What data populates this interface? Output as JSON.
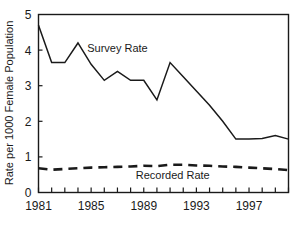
{
  "chart_data": {
    "type": "line",
    "title": "",
    "subtitle": "",
    "xlabel": "",
    "ylabel": "Rate per 1000 Female Population",
    "xlim": [
      1981,
      2000
    ],
    "ylim": [
      0,
      5
    ],
    "grid": false,
    "legend_position": "inline-annotation",
    "x": [
      1981,
      1982,
      1983,
      1984,
      1985,
      1986,
      1987,
      1988,
      1989,
      1990,
      1991,
      1992,
      1993,
      1994,
      1995,
      1996,
      1997,
      1998,
      1999,
      2000
    ],
    "xticks": [
      1981,
      1982,
      1983,
      1984,
      1985,
      1986,
      1987,
      1988,
      1989,
      1990,
      1991,
      1992,
      1993,
      1994,
      1995,
      1996,
      1997,
      1998,
      1999,
      2000
    ],
    "xtick_labels": [
      "1981",
      "",
      "",
      "",
      "1985",
      "",
      "",
      "",
      "1989",
      "",
      "",
      "",
      "1993",
      "",
      "",
      "",
      "1997",
      "",
      "",
      ""
    ],
    "xtick_labels_shown": [
      "1981",
      "1985",
      "1989",
      "1993",
      "1997"
    ],
    "yticks": [
      0,
      1,
      2,
      3,
      4,
      5
    ],
    "ytick_labels": [
      "0",
      "1",
      "2",
      "3",
      "4",
      "5"
    ],
    "series": [
      {
        "name": "Survey Rate",
        "style": "solid",
        "color": "#1a1a1a",
        "label_x": 1987.0,
        "label_y": 3.95,
        "values": [
          4.7,
          3.65,
          3.65,
          4.2,
          3.6,
          3.15,
          3.4,
          3.15,
          3.15,
          2.6,
          3.65,
          3.25,
          2.85,
          2.45,
          2.0,
          1.5,
          1.5,
          1.52,
          1.6,
          1.5
        ]
      },
      {
        "name": "Recorded Rate",
        "style": "dashed",
        "color": "#1a1a1a",
        "label_x": 1991.2,
        "label_y": 0.38,
        "values": [
          0.68,
          0.64,
          0.66,
          0.68,
          0.7,
          0.71,
          0.72,
          0.73,
          0.75,
          0.74,
          0.78,
          0.78,
          0.76,
          0.75,
          0.73,
          0.72,
          0.7,
          0.68,
          0.66,
          0.63
        ]
      }
    ]
  },
  "axes": {
    "ylabel": "Rate per 1000 Female Population",
    "frame_color": "#1a1a1a"
  }
}
